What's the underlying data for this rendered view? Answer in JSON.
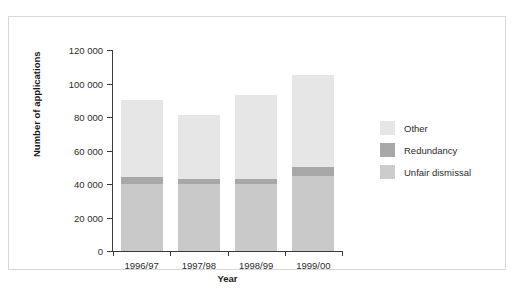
{
  "chart_data": {
    "type": "bar",
    "subtype": "stacked-bar",
    "title": "",
    "xlabel": "Year",
    "ylabel": "Number of applications",
    "categories": [
      "1996/97",
      "1997/98",
      "1998/99",
      "1999/00"
    ],
    "series": [
      {
        "name": "Unfair dismissal",
        "color": "#c9c9c9",
        "values": [
          40000,
          40000,
          40000,
          45000
        ]
      },
      {
        "name": "Redundancy",
        "color": "#a8a8a8",
        "values": [
          4000,
          3000,
          3000,
          5000
        ]
      },
      {
        "name": "Other",
        "color": "#e6e6e6",
        "values": [
          46000,
          38000,
          50000,
          55000
        ]
      }
    ],
    "totals": [
      90000,
      81000,
      93000,
      105000
    ],
    "ylim": [
      0,
      120000
    ],
    "yticks": [
      0,
      20000,
      40000,
      60000,
      80000,
      100000,
      120000
    ],
    "ytick_labels": [
      "0",
      "20 000",
      "40 000",
      "60 000",
      "80 000",
      "100 000",
      "120 000"
    ],
    "grid": false,
    "legend_position": "right"
  },
  "legend": {
    "items": [
      {
        "label": "Other",
        "color": "#e6e6e6"
      },
      {
        "label": "Redundancy",
        "color": "#a8a8a8"
      },
      {
        "label": "Unfair dismissal",
        "color": "#cccccc"
      }
    ]
  },
  "axes": {
    "x_title": "Year",
    "y_title": "Number of applications"
  },
  "caption": ""
}
